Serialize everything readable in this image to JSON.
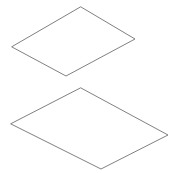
{
  "canvas": {
    "width": 177,
    "height": 173,
    "background_color": "#ffffff",
    "title": "Two outlined parallelogram shapes"
  },
  "style": {
    "stroke_color": "#5f5f64",
    "fill_color": "none",
    "stroke_width": 0.8,
    "stroke_linejoin": "round"
  },
  "shapes": [
    {
      "name": "upper-parallelogram",
      "label": "Upper parallelogram",
      "points": "81,7 135,39 66,76 12,47",
      "vertices": [
        {
          "name": "top",
          "x": 81,
          "y": 7
        },
        {
          "name": "right",
          "x": 135,
          "y": 39
        },
        {
          "name": "bottom",
          "x": 66,
          "y": 76
        },
        {
          "name": "left",
          "x": 12,
          "y": 47
        }
      ]
    },
    {
      "name": "lower-parallelogram",
      "label": "Lower parallelogram",
      "points": "81,88 168,135 101,169 11,124",
      "vertices": [
        {
          "name": "top",
          "x": 81,
          "y": 88
        },
        {
          "name": "right",
          "x": 168,
          "y": 135
        },
        {
          "name": "bottom",
          "x": 101,
          "y": 169
        },
        {
          "name": "left",
          "x": 11,
          "y": 124
        }
      ]
    }
  ]
}
